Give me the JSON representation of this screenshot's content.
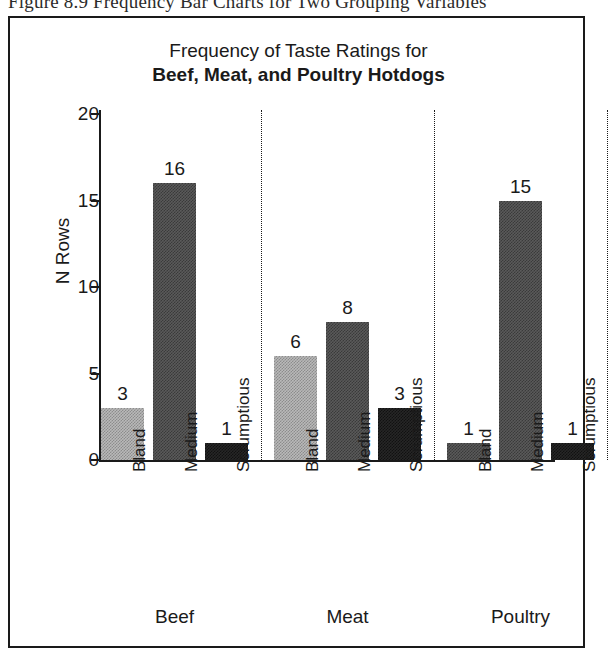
{
  "caption": "Figure 8.9  Frequency Bar Charts for Two Grouping Variables",
  "chart_data": {
    "type": "bar",
    "title": "Frequency of Taste Ratings for",
    "subtitle": "Beef, Meat, and Poultry Hotdogs",
    "xlabel": "",
    "ylabel": "N Rows",
    "ylim": [
      0,
      20
    ],
    "yticks": [
      "0",
      "5",
      "10",
      "15",
      "20"
    ],
    "grid": false,
    "legend": "none",
    "group_label_name": "Type",
    "categories": [
      "Bland",
      "Medium",
      "Scrumptious"
    ],
    "groups": [
      {
        "name": "Beef",
        "bars": [
          {
            "category": "Bland",
            "value": 3,
            "label": "3",
            "shade": "light"
          },
          {
            "category": "Medium",
            "value": 16,
            "label": "16",
            "shade": "mid"
          },
          {
            "category": "Scrumptious",
            "value": 1,
            "label": "1",
            "shade": "dark"
          }
        ]
      },
      {
        "name": "Meat",
        "bars": [
          {
            "category": "Bland",
            "value": 6,
            "label": "6",
            "shade": "light"
          },
          {
            "category": "Medium",
            "value": 8,
            "label": "8",
            "shade": "mid"
          },
          {
            "category": "Scrumptious",
            "value": 3,
            "label": "3",
            "shade": "dark"
          }
        ]
      },
      {
        "name": "Poultry",
        "bars": [
          {
            "category": "Bland",
            "value": 1,
            "label": "1",
            "shade": "mid"
          },
          {
            "category": "Medium",
            "value": 15,
            "label": "15",
            "shade": "mid"
          },
          {
            "category": "Scrumptious",
            "value": 1,
            "label": "1",
            "shade": "dark"
          }
        ]
      }
    ]
  },
  "colors": {
    "ink": "#1a1a1a",
    "light_shade": "#b9b9b9",
    "mid_shade": "#5a5a5a",
    "dark_shade": "#262626",
    "background": "#ffffff"
  }
}
